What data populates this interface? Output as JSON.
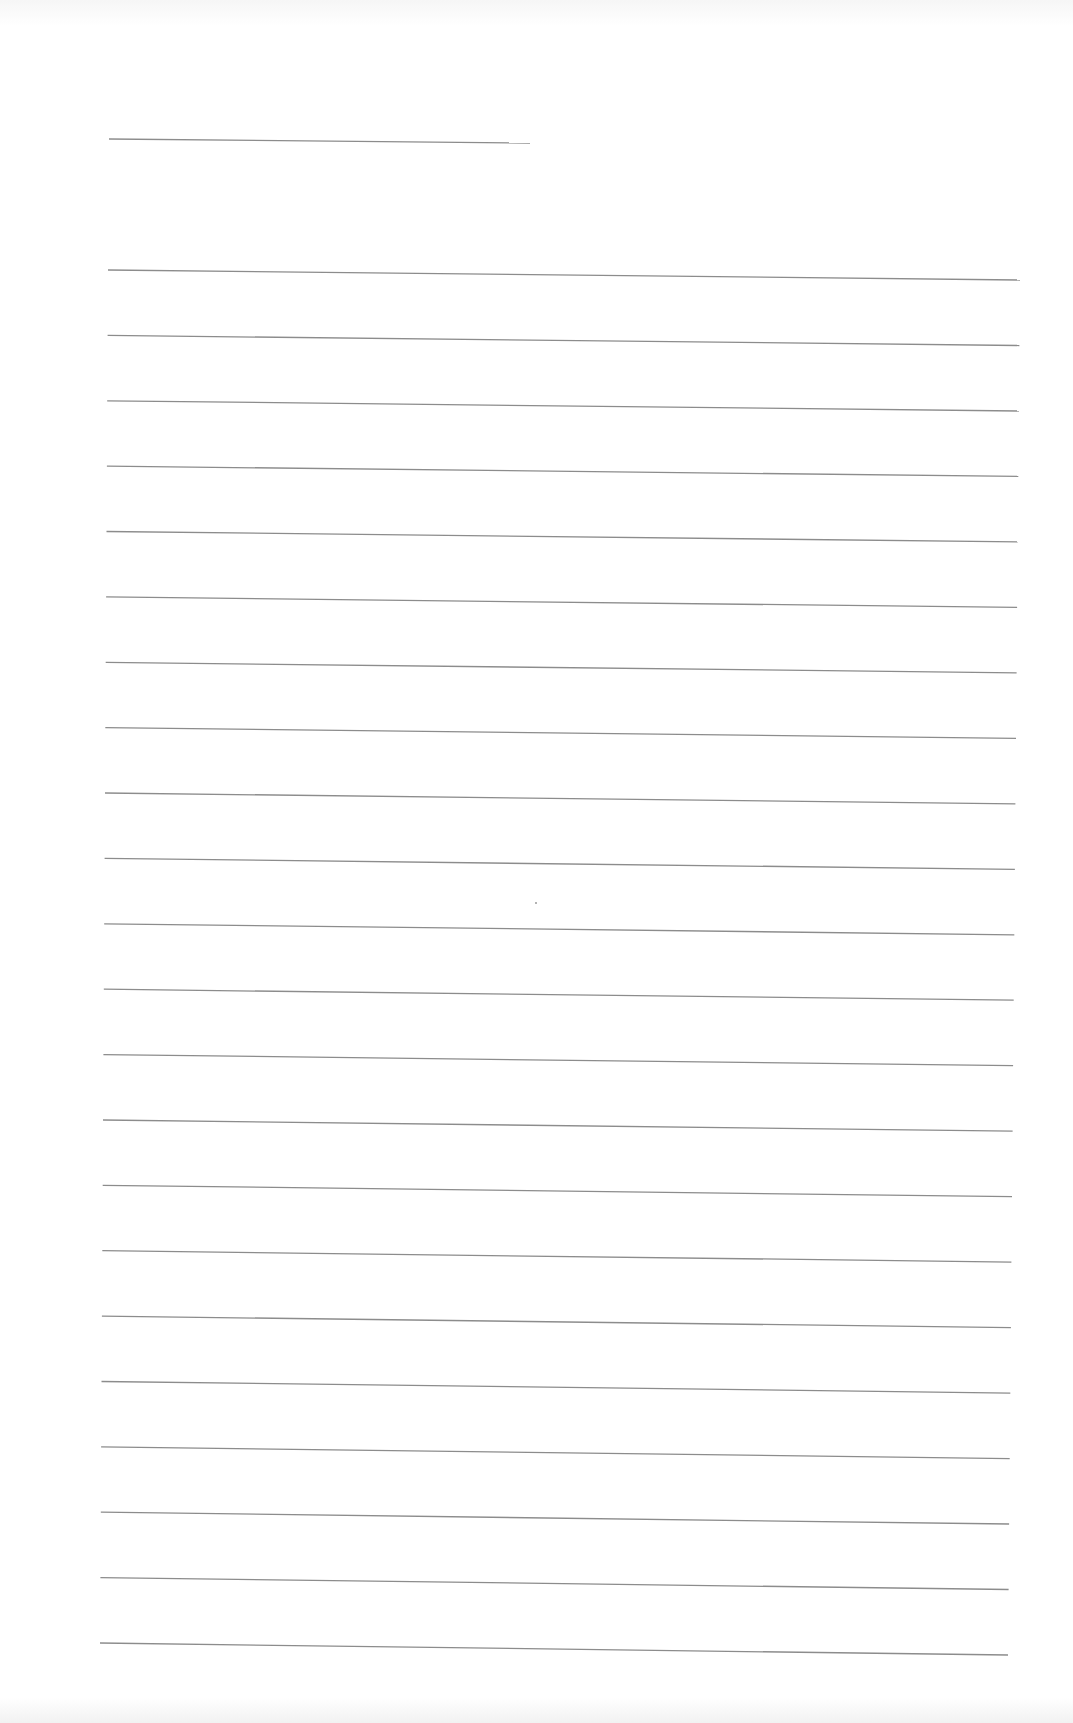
{
  "page": {
    "type": "lined-writing-sheet",
    "background_color": "#ffffff",
    "rule_color": "#8c8c8c"
  },
  "header_rule": {
    "x1": 109,
    "y1": 139,
    "x2": 530,
    "y2": 143
  },
  "body_rules": {
    "count": 22,
    "first": {
      "x1": 108,
      "y1": 270,
      "x2": 1020,
      "y2": 280
    },
    "last": {
      "x1": 100,
      "y1": 1643,
      "x2": 1008,
      "y2": 1655
    }
  },
  "marks": [
    {
      "x": 535,
      "y": 902
    }
  ]
}
